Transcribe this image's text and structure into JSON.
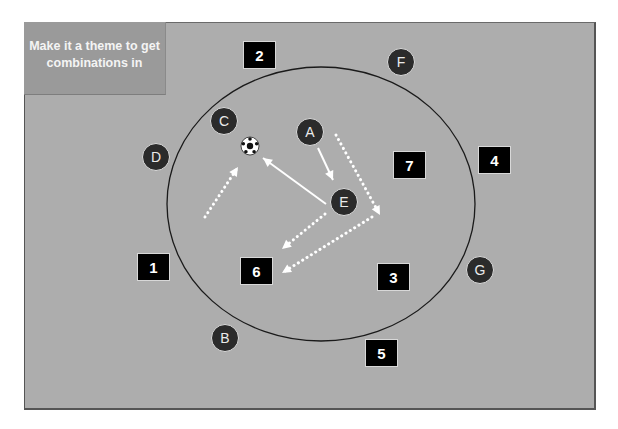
{
  "note": {
    "text": "Make it a theme to get combinations in"
  },
  "colors": {
    "field": "#adadad",
    "note_box": "#9a9a9a",
    "number_box": "#000000",
    "player": "#2b2b2b",
    "arrow": "#ffffff",
    "circle_line": "#1a1a1a"
  },
  "zones": [
    {
      "label": "1",
      "x": 137,
      "y": 253
    },
    {
      "label": "2",
      "x": 243,
      "y": 41
    },
    {
      "label": "3",
      "x": 377,
      "y": 263
    },
    {
      "label": "4",
      "x": 478,
      "y": 146
    },
    {
      "label": "5",
      "x": 365,
      "y": 339
    },
    {
      "label": "6",
      "x": 240,
      "y": 257
    },
    {
      "label": "7",
      "x": 393,
      "y": 151
    }
  ],
  "players": [
    {
      "label": "A",
      "cx": 310,
      "cy": 132
    },
    {
      "label": "B",
      "cx": 225,
      "cy": 338
    },
    {
      "label": "C",
      "cx": 224,
      "cy": 121
    },
    {
      "label": "D",
      "cx": 156,
      "cy": 157
    },
    {
      "label": "E",
      "cx": 344,
      "cy": 202
    },
    {
      "label": "F",
      "cx": 401,
      "cy": 62
    },
    {
      "label": "G",
      "cx": 480,
      "cy": 270
    }
  ],
  "ball": {
    "cx": 250,
    "cy": 146
  },
  "circle": {
    "cx": 321,
    "cy": 204,
    "rx": 154,
    "ry": 137
  },
  "arrows": [
    {
      "name": "pass-a-to-e",
      "style": "solid",
      "x1": 318,
      "y1": 148,
      "x2": 333,
      "y2": 180
    },
    {
      "name": "pass-e-to-ball",
      "style": "solid",
      "x1": 326,
      "y1": 204,
      "x2": 263,
      "y2": 158
    },
    {
      "name": "run-a-forward",
      "style": "dotted",
      "x1": 336,
      "y1": 135,
      "x2": 380,
      "y2": 215
    },
    {
      "name": "run-to-ball",
      "style": "dotted",
      "x1": 205,
      "y1": 217,
      "x2": 238,
      "y2": 167
    },
    {
      "name": "run-e-to-6",
      "style": "dotted",
      "x1": 325,
      "y1": 214,
      "x2": 282,
      "y2": 249
    },
    {
      "name": "run-right-to-6",
      "style": "dotted",
      "x1": 372,
      "y1": 217,
      "x2": 282,
      "y2": 273
    }
  ]
}
